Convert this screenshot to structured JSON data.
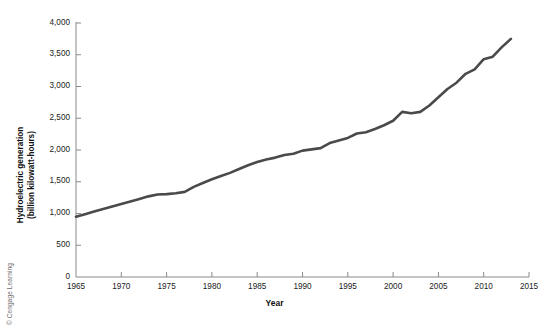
{
  "figure": {
    "credit": "© Cengage Learning",
    "background_color": "#ffffff",
    "line_color": "#4a4a4a",
    "axis_color": "#8a8a8a"
  },
  "chart_data": {
    "type": "line",
    "title": "",
    "subtitle": "",
    "xlabel": "Year",
    "ylabel": "Hydroelectric generation (billion kilowatt-hours)",
    "ylabel_line1": "Hydroelectric generation",
    "ylabel_line2": "(billion kilowatt-hours)",
    "xlim": [
      1965,
      2015
    ],
    "ylim": [
      0,
      4000
    ],
    "xticks": [
      1965,
      1970,
      1975,
      1980,
      1985,
      1990,
      1995,
      2000,
      2005,
      2010,
      2015
    ],
    "xtick_labels": [
      "1965",
      "1970",
      "1975",
      "1980",
      "1985",
      "1990",
      "1995",
      "2000",
      "2005",
      "2010",
      "2015"
    ],
    "yticks": [
      0,
      500,
      1000,
      1500,
      2000,
      2500,
      3000,
      3500,
      4000
    ],
    "ytick_labels": [
      "0",
      "500",
      "1,000",
      "1,500",
      "2,000",
      "2,500",
      "3,000",
      "3,500",
      "4,000"
    ],
    "grid": false,
    "legend": null,
    "legend_position": "none",
    "annotations": [],
    "series": [
      {
        "name": "World hydroelectric generation",
        "color": "#4a4a4a",
        "x": [
          1965,
          1966,
          1967,
          1968,
          1969,
          1970,
          1971,
          1972,
          1973,
          1974,
          1975,
          1976,
          1977,
          1978,
          1979,
          1980,
          1981,
          1982,
          1983,
          1984,
          1985,
          1986,
          1987,
          1988,
          1989,
          1990,
          1991,
          1992,
          1993,
          1994,
          1995,
          1996,
          1997,
          1998,
          1999,
          2000,
          2001,
          2002,
          2003,
          2004,
          2005,
          2006,
          2007,
          2008,
          2009,
          2010,
          2011,
          2012,
          2013
        ],
        "values": [
          950,
          990,
          1030,
          1070,
          1110,
          1150,
          1190,
          1230,
          1270,
          1300,
          1305,
          1320,
          1340,
          1420,
          1480,
          1540,
          1590,
          1640,
          1700,
          1760,
          1810,
          1850,
          1880,
          1920,
          1940,
          1990,
          2010,
          2030,
          2110,
          2150,
          2190,
          2260,
          2280,
          2330,
          2390,
          2460,
          2600,
          2580,
          2600,
          2700,
          2830,
          2960,
          3060,
          3200,
          3270,
          3430,
          3470,
          3620,
          3750
        ]
      }
    ]
  }
}
